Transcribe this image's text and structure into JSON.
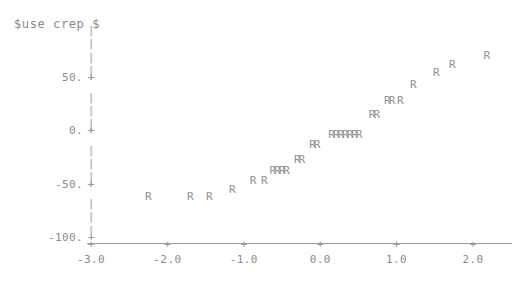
{
  "chart_data": {
    "type": "scatter",
    "title": "$use crep $",
    "xlabel": "",
    "ylabel": "",
    "marker_symbol": "R",
    "grid": false,
    "legend": null,
    "axis_style": "ascii-character-plot",
    "xlim": [
      -3.0,
      2.3
    ],
    "ylim": [
      -100.0,
      75.0
    ],
    "xticks": [
      -3.0,
      -2.0,
      -1.0,
      0.0,
      1.0,
      2.0
    ],
    "xtick_labels": [
      "-3.0",
      "-2.0",
      "-1.0",
      "0.0",
      "1.0",
      "2.0"
    ],
    "yticks": [
      50.0,
      0.0,
      -50.0,
      -100.0
    ],
    "ytick_labels": [
      "50.",
      "0.",
      "-50.",
      "-100."
    ],
    "points": [
      {
        "x": -2.25,
        "y": -62.0
      },
      {
        "x": -1.7,
        "y": -62.0
      },
      {
        "x": -1.45,
        "y": -62.0
      },
      {
        "x": -1.15,
        "y": -55.0
      },
      {
        "x": -0.88,
        "y": -47.0
      },
      {
        "x": -0.73,
        "y": -47.0
      },
      {
        "x": -0.62,
        "y": -37.0
      },
      {
        "x": -0.56,
        "y": -37.0
      },
      {
        "x": -0.5,
        "y": -37.0
      },
      {
        "x": -0.44,
        "y": -37.0
      },
      {
        "x": -0.3,
        "y": -27.0
      },
      {
        "x": -0.24,
        "y": -27.0
      },
      {
        "x": -0.1,
        "y": -13.0
      },
      {
        "x": -0.04,
        "y": -13.0
      },
      {
        "x": 0.15,
        "y": -3.0
      },
      {
        "x": 0.21,
        "y": -3.0
      },
      {
        "x": 0.27,
        "y": -3.0
      },
      {
        "x": 0.33,
        "y": -3.0
      },
      {
        "x": 0.39,
        "y": -3.0
      },
      {
        "x": 0.45,
        "y": -3.0
      },
      {
        "x": 0.51,
        "y": -3.0
      },
      {
        "x": 0.68,
        "y": 15.0
      },
      {
        "x": 0.74,
        "y": 15.0
      },
      {
        "x": 0.88,
        "y": 28.0
      },
      {
        "x": 0.94,
        "y": 28.0
      },
      {
        "x": 1.05,
        "y": 28.0
      },
      {
        "x": 1.22,
        "y": 43.0
      },
      {
        "x": 1.52,
        "y": 55.0
      },
      {
        "x": 1.73,
        "y": 62.0
      },
      {
        "x": 2.18,
        "y": 71.0
      }
    ]
  },
  "colors": {
    "marker": "#909090",
    "axis": "#9a9a9a",
    "text": "#8a8a8a",
    "background": "#ffffff"
  }
}
